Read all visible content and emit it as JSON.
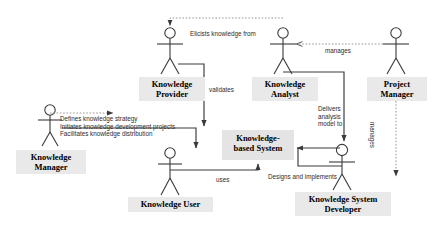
{
  "diagram": {
    "type": "uml-use-case-diagram",
    "background_color": "#ffffff",
    "actor_label_fill": "#e9e9e9",
    "usecase_label_fill": "#e4e4e4",
    "line_color": "#3a3a3a"
  },
  "actors": [
    {
      "id": "knowledge-provider",
      "label": "Knowledge\nProvider",
      "figure_x": 170,
      "figure_y": 22,
      "label_x": 139,
      "label_y": 77,
      "label_w": 66,
      "label_h": 24
    },
    {
      "id": "knowledge-analyst",
      "label": "Knowledge\nAnalyst",
      "figure_x": 283,
      "figure_y": 22,
      "label_x": 252,
      "label_y": 77,
      "label_w": 66,
      "label_h": 24
    },
    {
      "id": "project-manager",
      "label": "Project\nManager",
      "figure_x": 396,
      "figure_y": 22,
      "label_x": 367,
      "label_y": 77,
      "label_w": 60,
      "label_h": 24
    },
    {
      "id": "knowledge-manager",
      "label": "Knowledge\nManager",
      "figure_x": 50,
      "figure_y": 103,
      "label_x": 16,
      "label_y": 150,
      "label_w": 70,
      "label_h": 24
    },
    {
      "id": "knowledge-user",
      "label": "Knowledge User",
      "figure_x": 170,
      "figure_y": 148,
      "label_x": 128,
      "label_y": 197,
      "label_w": 85,
      "label_h": 15
    },
    {
      "id": "knowledge-system-developer",
      "label": "Knowledge System\nDeveloper",
      "figure_x": 342,
      "figure_y": 144,
      "label_x": 295,
      "label_y": 192,
      "label_w": 96,
      "label_h": 24
    }
  ],
  "usecases": [
    {
      "id": "knowledge-based-system",
      "label": "Knowledge-\nbased System",
      "x": 222,
      "y": 130,
      "w": 72,
      "h": 30
    }
  ],
  "edge_labels": [
    {
      "id": "elicits-knowledge-from",
      "text": "Elicists knowledge from",
      "x": 190,
      "y": 30
    },
    {
      "id": "manages-analyst",
      "text": "manages",
      "x": 325,
      "y": 47
    },
    {
      "id": "validates",
      "text": "validates",
      "x": 209,
      "y": 86
    },
    {
      "id": "delivers-analysis-model-to",
      "text": "Delivers\nanalysis\nmodel to",
      "x": 318,
      "y": 105
    },
    {
      "id": "knowledge-manager-responsibilities",
      "text": "Defines knowledge strategy\nInitiates knowledge development projects\nFacilitates knowledge distribution",
      "x": 60,
      "y": 115
    },
    {
      "id": "uses",
      "text": "uses",
      "x": 216,
      "y": 176
    },
    {
      "id": "designs-and-implements",
      "text": "Designs and implements",
      "x": 268,
      "y": 173
    },
    {
      "id": "manages-developer",
      "text": "manages",
      "x": 370,
      "y": 128
    }
  ]
}
